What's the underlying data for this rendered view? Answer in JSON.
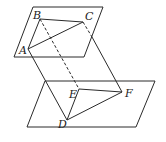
{
  "diagram": {
    "title": "",
    "stroke_color": "#2a2a2a",
    "planes": [
      {
        "name": "upper-plane",
        "points": [
          [
            33,
            7
          ],
          [
            103,
            7
          ],
          [
            84,
            57
          ],
          [
            14,
            57
          ]
        ]
      },
      {
        "name": "lower-plane",
        "points": [
          [
            45,
            81
          ],
          [
            155,
            81
          ],
          [
            136,
            127
          ],
          [
            27,
            127
          ]
        ]
      }
    ],
    "points": {
      "A": {
        "label": "A",
        "x": 28,
        "y": 49
      },
      "B": {
        "label": "B",
        "x": 40,
        "y": 19
      },
      "C": {
        "label": "C",
        "x": 83,
        "y": 22
      },
      "D": {
        "label": "D",
        "x": 67,
        "y": 120
      },
      "E": {
        "label": "E",
        "x": 79,
        "y": 89
      },
      "F": {
        "label": "F",
        "x": 122,
        "y": 92
      }
    },
    "segments": [
      {
        "from": "A",
        "to": "B",
        "style": "solid"
      },
      {
        "from": "B",
        "to": "C",
        "style": "solid"
      },
      {
        "from": "A",
        "to": "C",
        "style": "solid"
      },
      {
        "from": "A",
        "to": "D",
        "style": "solid"
      },
      {
        "from": "B",
        "to": "E",
        "style": "dashed"
      },
      {
        "from": "C",
        "to": "F",
        "style": "dashed-then-solid"
      },
      {
        "from": "E",
        "to": "F",
        "style": "solid"
      },
      {
        "from": "E",
        "to": "D",
        "style": "solid"
      },
      {
        "from": "D",
        "to": "F",
        "style": "solid"
      }
    ]
  }
}
